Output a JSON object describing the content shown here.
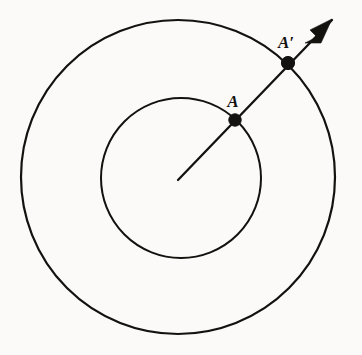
{
  "figure": {
    "name": "concentric-circles-radial-point-mapping",
    "background_color": "#fbfaf8",
    "ink_color": "#14120f",
    "width": 362,
    "height": 355
  },
  "geometry": {
    "center": {
      "x": 178,
      "y": 179
    },
    "inner_circle": {
      "cx": 181,
      "cy": 178,
      "r": 80,
      "stroke_width": 2.0
    },
    "outer_circle": {
      "cx": 178,
      "cy": 177,
      "r": 157,
      "stroke_width": 2.2
    },
    "ray": {
      "from_x": 178,
      "from_y": 180,
      "to_x": 332,
      "to_y": 20,
      "stroke_width": 2.3,
      "angle_degrees": -46
    },
    "arrow_head": {
      "tip_x": 332,
      "tip_y": 19,
      "points": "332,19 310,30 317,37 305,43 321,43"
    }
  },
  "points": [
    {
      "id": "A",
      "label": "A",
      "x": 235,
      "y": 120,
      "radius": 6.2,
      "label_x": 233,
      "label_y": 107,
      "label_size": 17,
      "on": "inner-circle"
    },
    {
      "id": "Aprime",
      "label": "A′",
      "x": 288,
      "y": 63,
      "radius": 6.6,
      "label_x": 286,
      "label_y": 48,
      "label_size": 17,
      "on": "outer-circle"
    }
  ]
}
